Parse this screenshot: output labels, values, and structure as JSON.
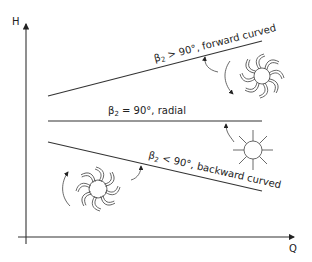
{
  "axes": {
    "y_label": "H",
    "x_label": "Q"
  },
  "curves": [
    {
      "id": "forward",
      "label": "β₂ > 90°, forward curved",
      "beta": "β",
      "sub": "2",
      "rest": " > 90°, forward curved"
    },
    {
      "id": "radial",
      "label": "β₂ = 90°, radial",
      "beta": "β",
      "sub": "2",
      "rest": " = 90°, radial"
    },
    {
      "id": "backward",
      "label": "β₂ < 90°, backward curved",
      "beta": "β",
      "sub": "2",
      "rest": " < 90°, backward curved"
    }
  ],
  "colors": {
    "line": "#333333",
    "background": "#ffffff"
  }
}
